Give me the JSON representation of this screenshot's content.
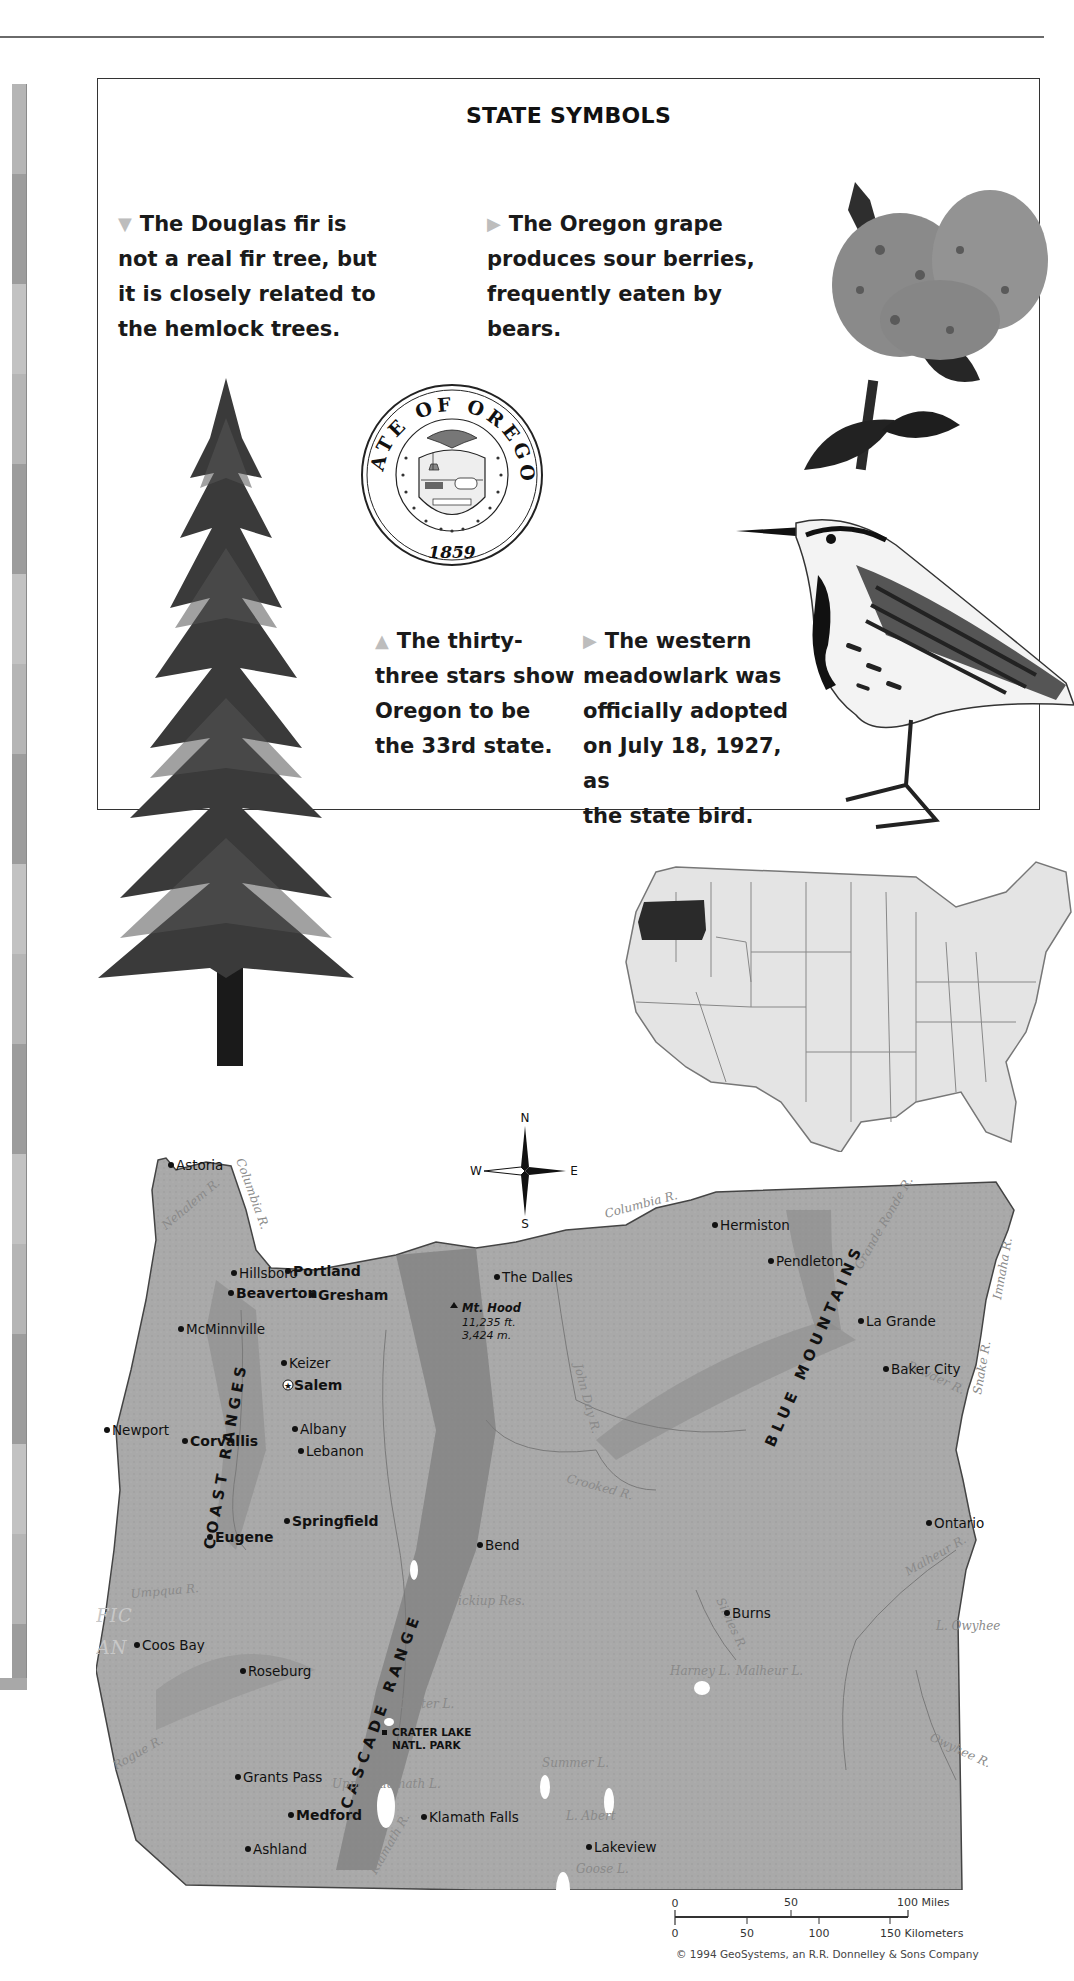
{
  "page": {
    "section_title": "STATE SYMBOLS"
  },
  "facts": {
    "fir": {
      "marker": "▼",
      "text_lines": [
        "The Douglas fir is",
        "not a real fir tree, but",
        "it is closely related to",
        "the hemlock trees."
      ]
    },
    "grape": {
      "marker": "▶",
      "text_lines": [
        "The Oregon grape",
        "produces sour berries,",
        "frequently eaten by bears."
      ]
    },
    "stars": {
      "marker": "▲",
      "text_lines": [
        "The thirty-",
        "three stars show",
        "Oregon to be",
        "the 33rd state."
      ]
    },
    "bird": {
      "marker": "▶",
      "text_lines": [
        "The western",
        "meadowlark was",
        "officially adopted",
        "on July 18, 1927, as",
        "the state bird."
      ]
    }
  },
  "seal": {
    "top_text": "STATE OF OREGON",
    "year": "1859",
    "banner": "THE UNION"
  },
  "illustrations": {
    "tree": "douglas-fir",
    "flower": "oregon-grape",
    "bird": "western-meadowlark",
    "locator": "us-locator-map-oregon-highlighted"
  },
  "compass": {
    "n": "N",
    "s": "S",
    "e": "E",
    "w": "W"
  },
  "map": {
    "ocean_label": [
      "PACIFIC",
      "OCEAN"
    ],
    "ranges": [
      "COAST RANGES",
      "CASCADE RANGE",
      "BLUE MOUNTAINS"
    ],
    "cities": [
      {
        "name": "Astoria",
        "x": 80,
        "y": 40
      },
      {
        "name": "Hillsboro",
        "x": 143,
        "y": 148
      },
      {
        "name": "Beaverton",
        "x": 140,
        "y": 168,
        "bold": true
      },
      {
        "name": "Portland",
        "x": 197,
        "y": 146,
        "bold": true,
        "big": true
      },
      {
        "name": "Gresham",
        "x": 222,
        "y": 170,
        "bold": true
      },
      {
        "name": "The Dalles",
        "x": 406,
        "y": 152
      },
      {
        "name": "McMinnville",
        "x": 90,
        "y": 204
      },
      {
        "name": "Keizer",
        "x": 193,
        "y": 238
      },
      {
        "name": "Salem",
        "x": 198,
        "y": 260,
        "bold": true,
        "capital": true
      },
      {
        "name": "Newport",
        "x": 16,
        "y": 305
      },
      {
        "name": "Albany",
        "x": 204,
        "y": 304
      },
      {
        "name": "Corvallis",
        "x": 94,
        "y": 316,
        "bold": true
      },
      {
        "name": "Lebanon",
        "x": 210,
        "y": 326
      },
      {
        "name": "Eugene",
        "x": 119,
        "y": 412,
        "bold": true
      },
      {
        "name": "Springfield",
        "x": 196,
        "y": 396,
        "bold": true
      },
      {
        "name": "Coos Bay",
        "x": 46,
        "y": 520
      },
      {
        "name": "Roseburg",
        "x": 152,
        "y": 546
      },
      {
        "name": "Grants Pass",
        "x": 147,
        "y": 652
      },
      {
        "name": "Medford",
        "x": 200,
        "y": 690,
        "bold": true
      },
      {
        "name": "Ashland",
        "x": 157,
        "y": 724
      },
      {
        "name": "Klamath Falls",
        "x": 333,
        "y": 692
      },
      {
        "name": "Bend",
        "x": 389,
        "y": 420
      },
      {
        "name": "Burns",
        "x": 636,
        "y": 488
      },
      {
        "name": "Lakeview",
        "x": 498,
        "y": 722
      },
      {
        "name": "Hermiston",
        "x": 624,
        "y": 100
      },
      {
        "name": "Pendleton",
        "x": 680,
        "y": 136
      },
      {
        "name": "La Grande",
        "x": 770,
        "y": 196
      },
      {
        "name": "Baker City",
        "x": 795,
        "y": 244
      },
      {
        "name": "Ontario",
        "x": 838,
        "y": 398
      }
    ],
    "mountain": {
      "name": "Mt. Hood",
      "elev_ft": "11,235 ft.",
      "elev_m": "3,424 m."
    },
    "park": [
      "CRATER LAKE",
      "NATL. PARK"
    ],
    "water": [
      "Columbia R.",
      "Nehalem R.",
      "Willamette R.",
      "Deschutes R.",
      "John Day R.",
      "Crooked R.",
      "Grande Ronde R.",
      "Imnaha R.",
      "Powder R.",
      "Snake R.",
      "Malheur R.",
      "Silvies R.",
      "Owyhee R.",
      "Umpqua R.",
      "Rogue R.",
      "Klamath R.",
      "Wickiup Res.",
      "Crater L.",
      "Upper Klamath L.",
      "Summer L.",
      "L. Abert",
      "Goose L.",
      "Harney L.",
      "Malheur L.",
      "L. Owyhee"
    ]
  },
  "scale": {
    "miles_ticks": [
      "0",
      "50",
      "100 Miles"
    ],
    "km_ticks": [
      "0",
      "50",
      "100",
      "150 Kilometers"
    ]
  },
  "credit": "© 1994 GeoSystems, an R.R. Donnelley & Sons Company"
}
